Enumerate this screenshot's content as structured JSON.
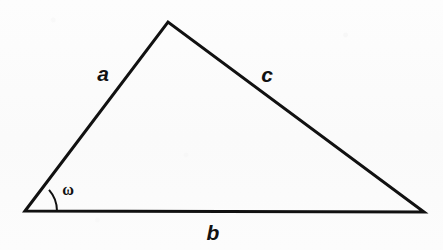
{
  "figure": {
    "kind": "geometry-diagram",
    "shape": "triangle",
    "background_color": "#fbfbfb",
    "stroke_color": "#111111",
    "stroke_width": 3,
    "canvas": {
      "width": 443,
      "height": 250
    }
  },
  "vertices": {
    "left": {
      "name": "left-vertex",
      "x": 25,
      "y": 211
    },
    "apex": {
      "name": "apex-vertex",
      "x": 168,
      "y": 22
    },
    "right": {
      "name": "right-vertex",
      "x": 424,
      "y": 212
    }
  },
  "edges": [
    {
      "id": "a",
      "label": "a",
      "from": "left",
      "to": "apex",
      "label_x": 103,
      "label_y": 73
    },
    {
      "id": "c",
      "label": "c",
      "from": "apex",
      "to": "right",
      "label_x": 267,
      "label_y": 74
    },
    {
      "id": "b",
      "label": "b",
      "from": "left",
      "to": "right",
      "label_x": 213,
      "label_y": 232
    }
  ],
  "angle": {
    "id": "omega",
    "label": "ω",
    "at_vertex": "left",
    "arc_radius": 32,
    "label_x": 68,
    "label_y": 190
  },
  "paths": {
    "triangle_outline": "M 25 211 L 168 22 L 424 212 Z",
    "angle_arc": "M 57 211 A 32 32 0 0 0 49.02 189.94"
  }
}
